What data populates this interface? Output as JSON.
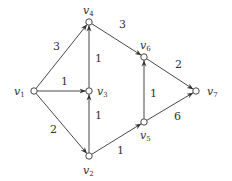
{
  "diagram": {
    "type": "directed weighted graph",
    "nodes": [
      {
        "id": "v1",
        "name": "v",
        "sub": "1",
        "x": 34,
        "y": 91,
        "lx": 14,
        "ly": 95
      },
      {
        "id": "v2",
        "name": "v",
        "sub": "2",
        "x": 89,
        "y": 156,
        "lx": 83,
        "ly": 174
      },
      {
        "id": "v3",
        "name": "v",
        "sub": "3",
        "x": 89,
        "y": 91,
        "lx": 97,
        "ly": 95
      },
      {
        "id": "v4",
        "name": "v",
        "sub": "4",
        "x": 89,
        "y": 22,
        "lx": 83,
        "ly": 14
      },
      {
        "id": "v5",
        "name": "v",
        "sub": "5",
        "x": 144,
        "y": 122,
        "lx": 140,
        "ly": 139
      },
      {
        "id": "v6",
        "name": "v",
        "sub": "6",
        "x": 144,
        "y": 57,
        "lx": 140,
        "ly": 49
      },
      {
        "id": "v7",
        "name": "v",
        "sub": "7",
        "x": 196,
        "y": 91,
        "lx": 207,
        "ly": 95
      }
    ],
    "edges": [
      {
        "from": "v1",
        "to": "v4",
        "weight": "3",
        "wx": 53,
        "wy": 50
      },
      {
        "from": "v1",
        "to": "v3",
        "weight": "1",
        "wx": 61,
        "wy": 85
      },
      {
        "from": "v1",
        "to": "v2",
        "weight": "2",
        "wx": 50,
        "wy": 133
      },
      {
        "from": "v3",
        "to": "v4",
        "weight": "1",
        "wx": 95,
        "wy": 62
      },
      {
        "from": "v2",
        "to": "v3",
        "weight": "1",
        "wx": 95,
        "wy": 119
      },
      {
        "from": "v4",
        "to": "v6",
        "weight": "3",
        "wx": 119,
        "wy": 28
      },
      {
        "from": "v2",
        "to": "v5",
        "weight": "1",
        "wx": 117,
        "wy": 154
      },
      {
        "from": "v5",
        "to": "v6",
        "weight": "1",
        "wx": 150,
        "wy": 97
      },
      {
        "from": "v6",
        "to": "v7",
        "weight": "2",
        "wx": 175,
        "wy": 68
      },
      {
        "from": "v5",
        "to": "v7",
        "weight": "6",
        "wx": 174,
        "wy": 120
      }
    ]
  }
}
